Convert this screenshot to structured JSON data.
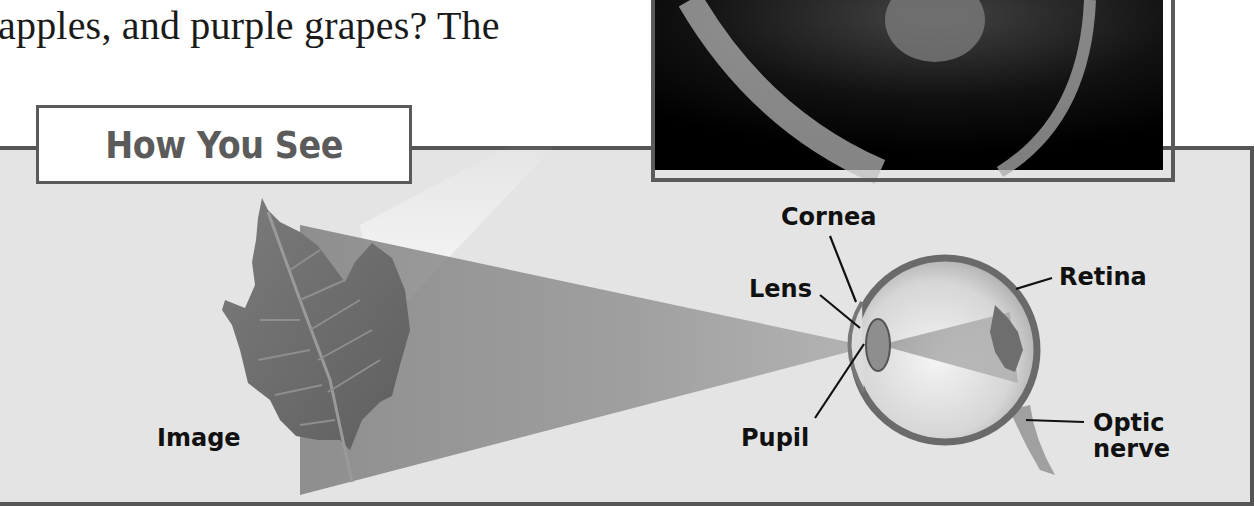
{
  "body_text": "apples, and purple grapes? The",
  "figure": {
    "title": "How You See",
    "labels": {
      "image": "Image",
      "cornea": "Cornea",
      "lens": "Lens",
      "retina": "Retina",
      "pupil": "Pupil",
      "optic_nerve_line1": "Optic",
      "optic_nerve_line2": "nerve"
    },
    "colors": {
      "panel_background": "#e4e4e4",
      "panel_border": "#555555",
      "title_text": "#5b5b5b",
      "leaf": "#6e6e6e",
      "light_cone": "#8c8c8c"
    }
  },
  "photo": {
    "description": "retina-photograph"
  }
}
